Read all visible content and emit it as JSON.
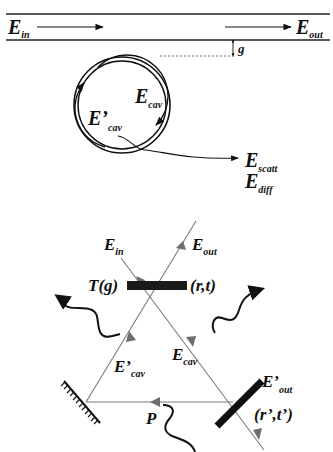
{
  "top_panel": {
    "waveguide": {
      "input_label": {
        "main": "E",
        "sub": "in"
      },
      "output_label": {
        "main": "E",
        "sub": "out"
      }
    },
    "gap_label": "g",
    "resonator": {
      "cw_label": {
        "main": "E",
        "sub": "cav"
      },
      "ccw_label": {
        "main": "E’",
        "sub": "cav"
      },
      "loss_labels": [
        {
          "main": "E",
          "sub": "scatt"
        },
        {
          "main": "E",
          "sub": "diff"
        }
      ]
    }
  },
  "bottom_panel": {
    "input_label": {
      "main": "E",
      "sub": "in"
    },
    "output_label": {
      "main": "E",
      "sub": "out"
    },
    "coupler_left_label": "T(g)",
    "coupler_right_label": "(r,t)",
    "cw_label": {
      "main": "E",
      "sub": "cav"
    },
    "ccw_label": {
      "main": "E’",
      "sub": "cav"
    },
    "output2_label": {
      "main": "E’",
      "sub": "out"
    },
    "mirror2_label": "(r’,t’)",
    "point_label": "P"
  },
  "colors": {
    "ink": "#111111",
    "beam": "#7a7a7a",
    "arrowhead": "#6e6e6e",
    "background": "#ffffff"
  }
}
